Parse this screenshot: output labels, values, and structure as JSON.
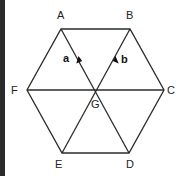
{
  "diagram": {
    "type": "regular-hexagon-vector-diagram",
    "vertices": [
      {
        "label": "A",
        "x": 61,
        "y": 29
      },
      {
        "label": "B",
        "x": 130,
        "y": 29
      },
      {
        "label": "C",
        "x": 164,
        "y": 90
      },
      {
        "label": "D",
        "x": 129,
        "y": 153
      },
      {
        "label": "E",
        "x": 62,
        "y": 153
      },
      {
        "label": "F",
        "x": 27,
        "y": 90
      }
    ],
    "centre": {
      "label": "G",
      "x": 96,
      "y": 90
    },
    "vectors": [
      {
        "label": "a",
        "from": "G",
        "to": "A"
      },
      {
        "label": "b",
        "from": "G",
        "to": "B"
      }
    ],
    "labels": {
      "A": "A",
      "B": "B",
      "C": "C",
      "D": "D",
      "E": "E",
      "F": "F",
      "G": "G",
      "a": "a",
      "b": "b"
    },
    "colors": {
      "line": "#2b2b2b",
      "text": "#222222",
      "edge_bar": "#2a2a2a"
    }
  }
}
